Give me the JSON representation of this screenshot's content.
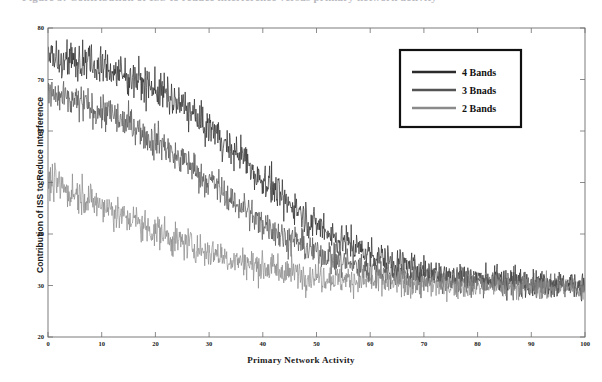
{
  "figure": {
    "caption_fragment": "Figure 5: Contribution of ISS to reduce interference versus primary network activity",
    "background_color": "#ffffff"
  },
  "chart_data": {
    "type": "line",
    "title": "",
    "xlabel": "Primary Network Activity",
    "ylabel": "Contribution of ISS to Reduce Interference",
    "xlim": [
      0,
      100
    ],
    "ylim": [
      20,
      80
    ],
    "xticks": [
      0,
      10,
      20,
      30,
      40,
      50,
      60,
      70,
      80,
      90,
      100
    ],
    "yticks": [
      20,
      30,
      40,
      50,
      60,
      70,
      80
    ],
    "grid": false,
    "legend_position": "upper right",
    "noise_amplitude": {
      "4 Bands": 2.6,
      "3 Bnads": 2.4,
      "2 Bands": 2.3
    },
    "series": [
      {
        "name": "4 Bands",
        "color": "#2b2b2b",
        "line_width": 0.7,
        "x": [
          0,
          5,
          10,
          15,
          20,
          25,
          30,
          35,
          40,
          45,
          50,
          55,
          60,
          65,
          70,
          75,
          80,
          85,
          90,
          95,
          100
        ],
        "values": [
          75.0,
          73.8,
          72.4,
          70.6,
          68.2,
          64.8,
          60.5,
          55.8,
          50.6,
          45.8,
          41.8,
          38.6,
          36.2,
          34.4,
          33.1,
          32.2,
          31.5,
          31.0,
          30.7,
          30.4,
          30.2
        ]
      },
      {
        "name": "3 Bnads",
        "color": "#545454",
        "line_width": 0.7,
        "x": [
          0,
          5,
          10,
          15,
          20,
          25,
          30,
          35,
          40,
          45,
          50,
          55,
          60,
          65,
          70,
          75,
          80,
          85,
          90,
          95,
          100
        ],
        "values": [
          67.0,
          65.6,
          63.8,
          61.4,
          58.2,
          54.4,
          50.2,
          46.0,
          42.2,
          39.0,
          36.5,
          34.6,
          33.2,
          32.2,
          31.5,
          31.0,
          30.6,
          30.4,
          30.2,
          30.1,
          30.0
        ]
      },
      {
        "name": "2 Bands",
        "color": "#8a8a8a",
        "line_width": 0.7,
        "x": [
          0,
          5,
          10,
          15,
          20,
          25,
          30,
          35,
          40,
          45,
          50,
          55,
          60,
          65,
          70,
          75,
          80,
          85,
          90,
          95,
          100
        ],
        "values": [
          50.0,
          48.0,
          45.6,
          43.0,
          40.6,
          38.4,
          36.5,
          34.9,
          33.6,
          32.6,
          31.8,
          31.2,
          30.8,
          30.4,
          30.2,
          30.0,
          29.9,
          29.8,
          29.7,
          29.6,
          29.5
        ]
      }
    ],
    "legend": [
      {
        "label": "4 Bands",
        "color": "#2b2b2b"
      },
      {
        "label": "3 Bnads",
        "color": "#545454"
      },
      {
        "label": "2 Bands",
        "color": "#8a8a8a"
      }
    ]
  },
  "axes_geometry": {
    "left": 48,
    "right": 585,
    "top": 28,
    "bottom": 337,
    "frame_color": "#6e6e6e"
  }
}
